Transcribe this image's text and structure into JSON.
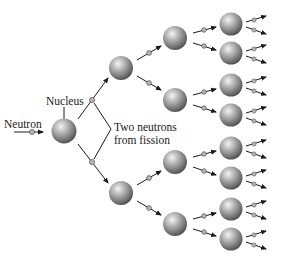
{
  "labels": {
    "neutron": "Neutron",
    "nucleus": "Nucleus",
    "fission_line1": "Two neutrons",
    "fission_line2": "from fission"
  },
  "colors": {
    "sphere_light": "#f2f2f2",
    "sphere_mid": "#9a9a9a",
    "sphere_dark": "#4a4a4a",
    "neutron_fill": "#b5b5b5",
    "arrow": "#1a1a1a",
    "background": "#ffffff"
  },
  "nuclei": [
    {
      "gen": 0,
      "x": 64,
      "y": 131
    },
    {
      "gen": 1,
      "x": 121,
      "y": 68
    },
    {
      "gen": 1,
      "x": 121,
      "y": 193
    },
    {
      "gen": 2,
      "x": 175,
      "y": 38
    },
    {
      "gen": 2,
      "x": 175,
      "y": 100
    },
    {
      "gen": 2,
      "x": 175,
      "y": 162
    },
    {
      "gen": 2,
      "x": 175,
      "y": 224
    },
    {
      "gen": 3,
      "x": 231,
      "y": 24
    },
    {
      "gen": 3,
      "x": 231,
      "y": 53
    },
    {
      "gen": 3,
      "x": 231,
      "y": 85
    },
    {
      "gen": 3,
      "x": 231,
      "y": 115
    },
    {
      "gen": 3,
      "x": 231,
      "y": 148
    },
    {
      "gen": 3,
      "x": 231,
      "y": 178
    },
    {
      "gen": 3,
      "x": 231,
      "y": 209
    },
    {
      "gen": 3,
      "x": 231,
      "y": 239
    }
  ]
}
